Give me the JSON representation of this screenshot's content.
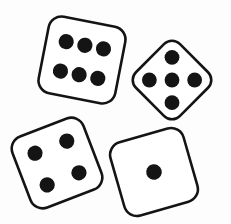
{
  "scene": {
    "title": "Four dice",
    "description": "Photograph-style line drawing of four six-sided dice scattered on a white background",
    "width": 231,
    "height": 224,
    "background_color": "#fdfdfd",
    "ink_color": "#141414",
    "face_color": "#ffffff",
    "stroke_width": 2.6,
    "total_pips": 16
  },
  "dice": [
    {
      "id": "die-top-left",
      "value": 6,
      "value_label": "6",
      "position_label": "top-left",
      "center_x": 82,
      "center_y": 60,
      "size": 78,
      "corner_radius": 13,
      "rotation_deg": 11,
      "pips": [
        {
          "x": -19,
          "y": -15,
          "r": 7.6
        },
        {
          "x": 0,
          "y": -15,
          "r": 7.6
        },
        {
          "x": 19,
          "y": -15,
          "r": 7.6
        },
        {
          "x": -19,
          "y": 15,
          "r": 7.6
        },
        {
          "x": 0,
          "y": 15,
          "r": 7.6
        },
        {
          "x": 19,
          "y": 15,
          "r": 7.6
        }
      ]
    },
    {
      "id": "die-top-right",
      "value": 5,
      "value_label": "5",
      "position_label": "top-right",
      "center_x": 172,
      "center_y": 80,
      "size": 62,
      "corner_radius": 11,
      "rotation_deg": 45,
      "pips": [
        {
          "x": -16,
          "y": -16,
          "r": 7.4
        },
        {
          "x": 16,
          "y": -16,
          "r": 7.4
        },
        {
          "x": 0,
          "y": 0,
          "r": 7.4
        },
        {
          "x": -16,
          "y": 16,
          "r": 7.4
        },
        {
          "x": 16,
          "y": 16,
          "r": 7.4
        }
      ]
    },
    {
      "id": "die-bottom-left",
      "value": 4,
      "value_label": "4",
      "position_label": "bottom-left",
      "center_x": 57,
      "center_y": 163,
      "size": 76,
      "corner_radius": 13,
      "rotation_deg": -21,
      "pips": [
        {
          "x": -17,
          "y": -17,
          "r": 7.6
        },
        {
          "x": 17,
          "y": -17,
          "r": 7.6
        },
        {
          "x": -17,
          "y": 17,
          "r": 7.6
        },
        {
          "x": 17,
          "y": 17,
          "r": 7.6
        }
      ]
    },
    {
      "id": "die-bottom-right",
      "value": 1,
      "value_label": "1",
      "position_label": "bottom-right",
      "center_x": 154,
      "center_y": 172,
      "size": 76,
      "corner_radius": 13,
      "rotation_deg": -16,
      "pips": [
        {
          "x": 0,
          "y": 0,
          "r": 7.8
        }
      ]
    }
  ]
}
